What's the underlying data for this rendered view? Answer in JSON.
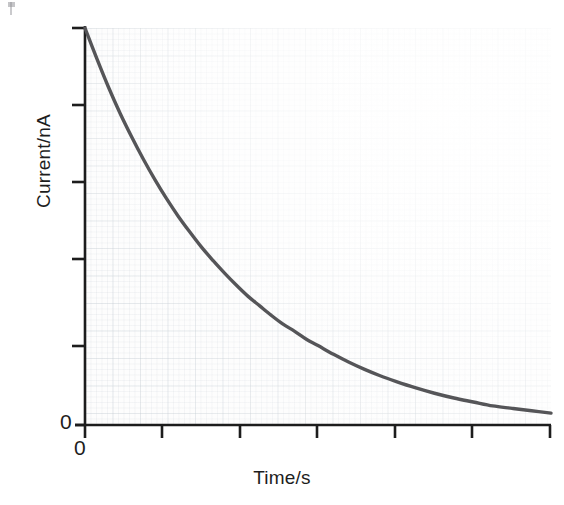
{
  "figure": {
    "alt_description": "Exponential decay of current versus time",
    "background_color": "#ffffff",
    "curve_color": "#555558",
    "axis_color": "#1d1d1d",
    "grid_color": "#b0bac4"
  },
  "chart_data": {
    "type": "line",
    "title": "",
    "subtitle": "",
    "xlabel": "Time/s",
    "ylabel": "Current/nA",
    "grid": true,
    "grid_style": "graph-paper",
    "legend": false,
    "legend_position": "none",
    "xlim": [
      0,
      6
    ],
    "ylim": [
      0,
      5
    ],
    "xticks": [
      0,
      1,
      2,
      3,
      4,
      5,
      6
    ],
    "yticks": [
      0,
      1,
      2,
      3,
      4,
      5
    ],
    "xticklabels": [
      "0",
      "",
      "",
      "",
      "",
      "",
      ""
    ],
    "yticklabels": [
      "0",
      "",
      "",
      "",
      "",
      ""
    ],
    "annotations": [],
    "series": [
      {
        "name": "Current",
        "form": "exponential decay",
        "x": [
          0.0,
          0.15,
          0.3,
          0.45,
          0.6,
          0.75,
          0.9,
          1.05,
          1.2,
          1.35,
          1.5,
          1.65,
          1.8,
          1.95,
          2.1,
          2.25,
          2.4,
          2.55,
          2.7,
          2.85,
          3.0,
          3.2,
          3.4,
          3.6,
          3.8,
          4.0,
          4.25,
          4.5,
          4.75,
          5.0,
          5.25,
          5.5,
          5.75,
          6.0
        ],
        "y": [
          5.0,
          4.62,
          4.26,
          3.93,
          3.63,
          3.35,
          3.09,
          2.85,
          2.63,
          2.43,
          2.24,
          2.07,
          1.91,
          1.76,
          1.62,
          1.5,
          1.38,
          1.27,
          1.18,
          1.08,
          1.0,
          0.89,
          0.79,
          0.7,
          0.62,
          0.55,
          0.47,
          0.4,
          0.34,
          0.29,
          0.24,
          0.21,
          0.18,
          0.15
        ]
      }
    ]
  },
  "labels": {
    "y_origin": "0",
    "x_origin": "0"
  }
}
